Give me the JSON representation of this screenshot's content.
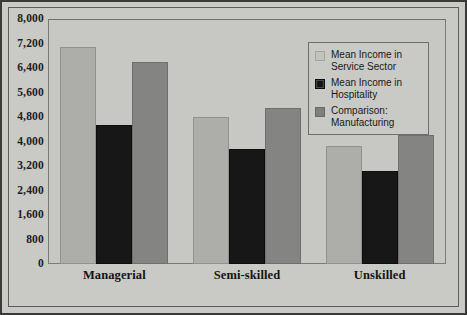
{
  "chart_data": {
    "type": "bar",
    "title": "",
    "xlabel": "",
    "ylabel": "",
    "ylim": [
      0,
      8000
    ],
    "grid": false,
    "legend_position": "top-right",
    "categories": [
      "Managerial",
      "Semi-skilled",
      "Unskilled"
    ],
    "yticks": [
      "8,000",
      "7,200",
      "6,400",
      "5,600",
      "4,800",
      "4,000",
      "3,200",
      "2,400",
      "1,600",
      "800",
      "0"
    ],
    "ytick_values": [
      8000,
      7200,
      6400,
      5600,
      4800,
      4000,
      3200,
      2400,
      1600,
      800,
      0
    ],
    "series": [
      {
        "name": "Mean Income in Service Sector",
        "name_line1": "Mean Income in",
        "name_line2": "Service Sector",
        "color": "#adadaa",
        "values": [
          7100,
          4800,
          3850
        ]
      },
      {
        "name": "Mean Income in Hospitality",
        "name_line1": "Mean Income in",
        "name_line2": "Hospitality",
        "color": "#171717",
        "values": [
          4550,
          3750,
          3050
        ]
      },
      {
        "name": "Comparison: Manufacturing",
        "name_line1": "Comparison:",
        "name_line2": "Manufacturing",
        "color": "#848482",
        "values": [
          6600,
          5100,
          4200
        ]
      }
    ]
  }
}
